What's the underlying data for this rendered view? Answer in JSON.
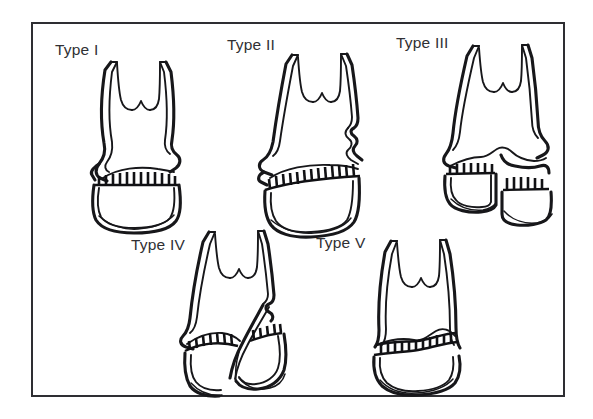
{
  "figure": {
    "kind": "medical-illustration",
    "frame_border_color": "#2e2e32",
    "background_color": "#ffffff",
    "ink_color": "#17171a",
    "label_color": "#303034"
  },
  "panels": [
    {
      "id": "type-1",
      "label": "Type I",
      "label_x": 55,
      "label_y": 55,
      "bone_description": "intact long bone with transverse fracture through the growth plate (physis) only"
    },
    {
      "id": "type-2",
      "label": "Type II",
      "label_x": 227,
      "label_y": 50,
      "bone_description": "fracture through physis extending into the metaphysis, triangular metaphyseal fragment"
    },
    {
      "id": "type-3",
      "label": "Type III",
      "label_x": 396,
      "label_y": 48,
      "bone_description": "fracture through physis extending into the epiphysis, displaced epiphyseal fragment"
    },
    {
      "id": "type-4",
      "label": "Type IV",
      "label_x": 131,
      "label_y": 250,
      "bone_description": "oblique fracture crossing metaphysis, physis and epiphysis"
    },
    {
      "id": "type-5",
      "label": "Type V",
      "label_x": 316,
      "label_y": 248,
      "bone_description": "crush or compression injury of the growth plate"
    }
  ]
}
